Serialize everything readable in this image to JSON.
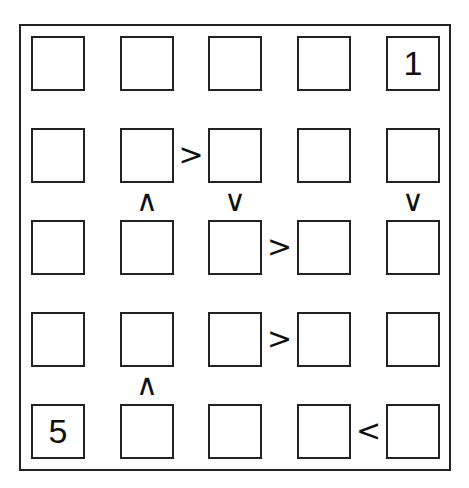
{
  "puzzle": {
    "type": "futoshiki",
    "size": 5,
    "grid": [
      [
        "",
        "",
        "",
        "",
        "1"
      ],
      [
        "",
        "",
        "",
        "",
        ""
      ],
      [
        "",
        "",
        "",
        "",
        ""
      ],
      [
        "",
        "",
        "",
        "",
        ""
      ],
      [
        "5",
        "",
        "",
        "",
        ""
      ]
    ],
    "horizontal_constraints": [
      {
        "row": 1,
        "between_cols": [
          1,
          2
        ],
        "symbol": ">"
      },
      {
        "row": 2,
        "between_cols": [
          2,
          3
        ],
        "symbol": ">"
      },
      {
        "row": 3,
        "between_cols": [
          2,
          3
        ],
        "symbol": ">"
      },
      {
        "row": 4,
        "between_cols": [
          3,
          4
        ],
        "symbol": "<"
      }
    ],
    "vertical_constraints": [
      {
        "col": 1,
        "between_rows": [
          1,
          2
        ],
        "symbol": "∧"
      },
      {
        "col": 2,
        "between_rows": [
          1,
          2
        ],
        "symbol": "∨"
      },
      {
        "col": 4,
        "between_rows": [
          1,
          2
        ],
        "symbol": "∨"
      },
      {
        "col": 1,
        "between_rows": [
          3,
          4
        ],
        "symbol": "∧"
      }
    ]
  }
}
